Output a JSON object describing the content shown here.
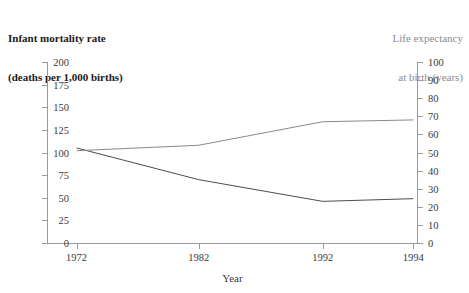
{
  "titles": {
    "left_axis_title_line1": "Infant mortality rate",
    "left_axis_title_line2": "(deaths per 1,000 births)",
    "right_axis_title_line1": "Life expectancy",
    "right_axis_title_line2": "at birth (years)"
  },
  "axes": {
    "x_label": "Year",
    "x_ticklabels": [
      "1972",
      "1982",
      "1992",
      "1994"
    ],
    "left_ticklabels": [
      "0",
      "25",
      "50",
      "75",
      "100",
      "125",
      "150",
      "175",
      "200"
    ],
    "right_ticklabels": [
      "0",
      "10",
      "20",
      "30",
      "40",
      "50",
      "60",
      "70",
      "80",
      "90",
      "100"
    ]
  },
  "colors": {
    "left_title": "#1a1a1a",
    "right_title": "#8c8c8c",
    "axis": "#9a9a9a",
    "infant_mortality_line": "#4d4d4d",
    "life_expectancy_line": "#8a8a8a",
    "background": "#ffffff"
  },
  "chart_data": {
    "type": "line",
    "title": "",
    "xlabel": "Year",
    "x": [
      "1972",
      "1982",
      "1992",
      "1994"
    ],
    "x_positions": [
      0.08,
      0.41,
      0.745,
      0.99
    ],
    "grid": false,
    "legend": "none",
    "series": [
      {
        "name": "Infant mortality rate (deaths per 1,000 births)",
        "axis": "left",
        "ylabel": "Infant mortality rate (deaths per 1,000 births)",
        "ylim": [
          0,
          200
        ],
        "yticks": [
          0,
          25,
          50,
          75,
          100,
          125,
          150,
          175,
          200
        ],
        "values": [
          105,
          70,
          46,
          49
        ],
        "color": "#4d4d4d"
      },
      {
        "name": "Life expectancy at birth (years)",
        "axis": "right",
        "ylabel": "Life expectancy at birth (years)",
        "ylim": [
          0,
          100
        ],
        "yticks": [
          0,
          10,
          20,
          30,
          40,
          50,
          60,
          70,
          80,
          90,
          100
        ],
        "values": [
          51,
          54,
          67,
          68
        ],
        "color": "#8a8a8a"
      }
    ]
  }
}
